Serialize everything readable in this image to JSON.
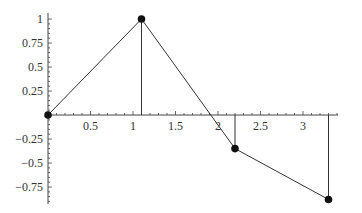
{
  "chart_data": {
    "type": "line",
    "title": "",
    "xlabel": "",
    "ylabel": "",
    "xlim": [
      0,
      3.4
    ],
    "ylim": [
      -0.92,
      1.06
    ],
    "grid": false,
    "legend": null,
    "x_ticks": [
      "0.5",
      "1",
      "1.5",
      "2",
      "2.5",
      "3"
    ],
    "y_ticks": [
      "1",
      "0.75",
      "0.5",
      "0.25",
      "-0.25",
      "-0.5",
      "-0.75"
    ],
    "series": [
      {
        "name": "polyline",
        "points": [
          {
            "x": 0,
            "y": 0
          },
          {
            "x": 1.1,
            "y": 1
          },
          {
            "x": 2.2,
            "y": -0.35
          },
          {
            "x": 3.3,
            "y": -0.88
          }
        ],
        "markers": true
      }
    ],
    "drop_lines": [
      {
        "x": 1.1,
        "y": 1
      },
      {
        "x": 2.2,
        "y": -0.35
      },
      {
        "x": 3.3,
        "y": -0.88
      }
    ]
  },
  "style": {
    "line_color": "#333333",
    "marker_color": "#111111",
    "axis_color": "#444444"
  }
}
